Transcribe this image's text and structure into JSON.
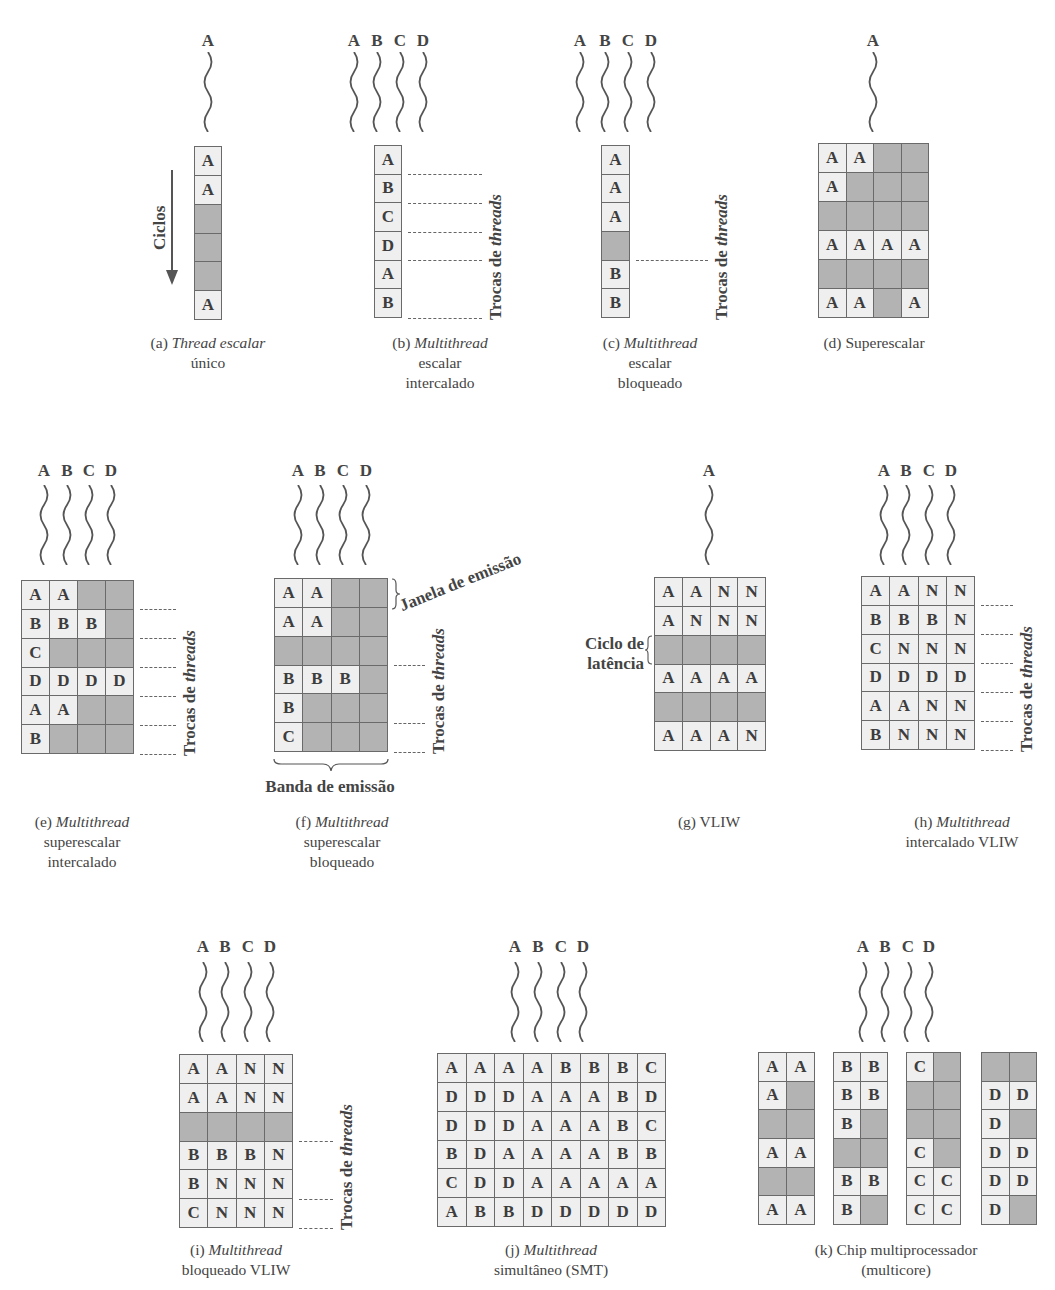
{
  "colors": {
    "filled_cell": "#efefef",
    "empty_cell": "#b3b3b3",
    "grid_line": "#6a6a6a",
    "text": "#3d3d3d"
  },
  "common": {
    "thread_switches_label_prefix": "Trocas de ",
    "thread_switches_label_italic": "threads",
    "cycles_label": "Ciclos",
    "issue_window_label": "Janela de emissão",
    "issue_slot_label": "Banda de emissão",
    "latency_cycle_label_line1": "Ciclo de",
    "latency_cycle_label_line2": "latência"
  },
  "panels": [
    {
      "id": "a",
      "threads": [
        "A"
      ],
      "caption": {
        "prefix": "(a) ",
        "italic": "Thread escalar",
        "rest_line1": "",
        "line2": "único",
        "line3": ""
      },
      "grid": [
        [
          "A"
        ],
        [
          "A"
        ],
        [
          ""
        ],
        [
          ""
        ],
        [
          ""
        ],
        [
          "A"
        ]
      ],
      "switch_rows": []
    },
    {
      "id": "b",
      "threads": [
        "A",
        "B",
        "C",
        "D"
      ],
      "caption": {
        "prefix": "(b) ",
        "italic": "Multithread",
        "rest_line1": "",
        "line2": "escalar",
        "line3": "intercalado"
      },
      "grid": [
        [
          "A"
        ],
        [
          "B"
        ],
        [
          "C"
        ],
        [
          "D"
        ],
        [
          "A"
        ],
        [
          "B"
        ]
      ],
      "switch_rows": [
        1,
        2,
        3,
        4,
        6
      ]
    },
    {
      "id": "c",
      "threads": [
        "A",
        "B",
        "C",
        "D"
      ],
      "caption": {
        "prefix": "(c) ",
        "italic": "Multithread",
        "rest_line1": "",
        "line2": "escalar",
        "line3": "bloqueado"
      },
      "grid": [
        [
          "A"
        ],
        [
          "A"
        ],
        [
          "A"
        ],
        [
          ""
        ],
        [
          "B"
        ],
        [
          "B"
        ]
      ],
      "switch_rows": [
        4
      ]
    },
    {
      "id": "d",
      "threads": [
        "A"
      ],
      "caption": {
        "prefix": "(d) ",
        "italic": "",
        "rest_line1": "Superescalar",
        "line2": "",
        "line3": ""
      },
      "grid": [
        [
          "A",
          "A",
          "",
          ""
        ],
        [
          "A",
          "",
          "",
          ""
        ],
        [
          "",
          "",
          "",
          ""
        ],
        [
          "A",
          "A",
          "A",
          "A"
        ],
        [
          "",
          "",
          "",
          ""
        ],
        [
          "A",
          "A",
          "",
          "A"
        ]
      ],
      "switch_rows": []
    },
    {
      "id": "e",
      "threads": [
        "A",
        "B",
        "C",
        "D"
      ],
      "caption": {
        "prefix": "(e) ",
        "italic": "Multithread",
        "rest_line1": "",
        "line2": "superescalar",
        "line3": "intercalado"
      },
      "grid": [
        [
          "A",
          "A",
          "",
          ""
        ],
        [
          "B",
          "B",
          "B",
          ""
        ],
        [
          "C",
          "",
          "",
          ""
        ],
        [
          "D",
          "D",
          "D",
          "D"
        ],
        [
          "A",
          "A",
          "",
          ""
        ],
        [
          "B",
          "",
          "",
          ""
        ]
      ],
      "switch_rows": [
        1,
        2,
        3,
        4,
        5,
        6
      ]
    },
    {
      "id": "f",
      "threads": [
        "A",
        "B",
        "C",
        "D"
      ],
      "caption": {
        "prefix": "(f) ",
        "italic": "Multithread",
        "rest_line1": "",
        "line2": "superescalar",
        "line3": "bloqueado"
      },
      "grid": [
        [
          "A",
          "A",
          "",
          ""
        ],
        [
          "A",
          "A",
          "",
          ""
        ],
        [
          "",
          "",
          "",
          ""
        ],
        [
          "B",
          "B",
          "B",
          ""
        ],
        [
          "B",
          "",
          "",
          ""
        ],
        [
          "C",
          "",
          "",
          ""
        ]
      ],
      "switch_rows": [
        3,
        5,
        6
      ]
    },
    {
      "id": "g",
      "threads": [
        "A"
      ],
      "caption": {
        "prefix": "(g) ",
        "italic": "",
        "rest_line1": "VLIW",
        "line2": "",
        "line3": ""
      },
      "grid": [
        [
          "A",
          "A",
          "N",
          "N"
        ],
        [
          "A",
          "N",
          "N",
          "N"
        ],
        [
          "",
          "",
          "",
          ""
        ],
        [
          "A",
          "A",
          "A",
          "A"
        ],
        [
          "",
          "",
          "",
          ""
        ],
        [
          "A",
          "A",
          "A",
          "N"
        ]
      ],
      "switch_rows": []
    },
    {
      "id": "h",
      "threads": [
        "A",
        "B",
        "C",
        "D"
      ],
      "caption": {
        "prefix": "(h) ",
        "italic": "Multithread",
        "rest_line1": "",
        "line2": "intercalado VLIW",
        "line3": ""
      },
      "grid": [
        [
          "A",
          "A",
          "N",
          "N"
        ],
        [
          "B",
          "B",
          "B",
          "N"
        ],
        [
          "C",
          "N",
          "N",
          "N"
        ],
        [
          "D",
          "D",
          "D",
          "D"
        ],
        [
          "A",
          "A",
          "N",
          "N"
        ],
        [
          "B",
          "N",
          "N",
          "N"
        ]
      ],
      "switch_rows": [
        1,
        2,
        3,
        4,
        5,
        6
      ]
    },
    {
      "id": "i",
      "threads": [
        "A",
        "B",
        "C",
        "D"
      ],
      "caption": {
        "prefix": "(i) ",
        "italic": "Multithread",
        "rest_line1": "",
        "line2": "bloqueado VLIW",
        "line3": ""
      },
      "grid": [
        [
          "A",
          "A",
          "N",
          "N"
        ],
        [
          "A",
          "A",
          "N",
          "N"
        ],
        [
          "",
          "",
          "",
          ""
        ],
        [
          "B",
          "B",
          "B",
          "N"
        ],
        [
          "B",
          "N",
          "N",
          "N"
        ],
        [
          "C",
          "N",
          "N",
          "N"
        ]
      ],
      "switch_rows": [
        3,
        5,
        6
      ]
    },
    {
      "id": "j",
      "threads": [
        "A",
        "B",
        "C",
        "D"
      ],
      "caption": {
        "prefix": "(j) ",
        "italic": "Multithread",
        "rest_line1": "",
        "line2": "simultâneo (SMT)",
        "line3": ""
      },
      "grid": [
        [
          "A",
          "A",
          "A",
          "A",
          "B",
          "B",
          "B",
          "C"
        ],
        [
          "D",
          "D",
          "D",
          "A",
          "A",
          "A",
          "B",
          "D"
        ],
        [
          "D",
          "D",
          "D",
          "A",
          "A",
          "A",
          "B",
          "C"
        ],
        [
          "B",
          "D",
          "A",
          "A",
          "A",
          "A",
          "B",
          "B"
        ],
        [
          "C",
          "D",
          "D",
          "A",
          "A",
          "A",
          "A",
          "A"
        ],
        [
          "A",
          "B",
          "B",
          "D",
          "D",
          "D",
          "D",
          "D"
        ]
      ],
      "switch_rows": []
    },
    {
      "id": "k",
      "threads": [
        "A",
        "B",
        "C",
        "D"
      ],
      "caption": {
        "prefix": "(k) ",
        "italic": "",
        "rest_line1": "Chip multiprocessador",
        "line2": "(multicore)",
        "line3": ""
      },
      "cores": [
        [
          [
            "A",
            "A"
          ],
          [
            "A",
            ""
          ],
          [
            "",
            ""
          ],
          [
            "A",
            "A"
          ],
          [
            "",
            ""
          ],
          [
            "A",
            "A"
          ]
        ],
        [
          [
            "B",
            "B"
          ],
          [
            "B",
            "B"
          ],
          [
            "B",
            ""
          ],
          [
            "",
            ""
          ],
          [
            "B",
            "B"
          ],
          [
            "B",
            ""
          ]
        ],
        [
          [
            "C",
            ""
          ],
          [
            "",
            ""
          ],
          [
            "",
            ""
          ],
          [
            "C",
            ""
          ],
          [
            "C",
            "C"
          ],
          [
            "C",
            "C"
          ]
        ],
        [
          [
            "",
            ""
          ],
          [
            "D",
            "D"
          ],
          [
            "D",
            ""
          ],
          [
            "D",
            "D"
          ],
          [
            "D",
            "D"
          ],
          [
            "D",
            ""
          ]
        ]
      ],
      "switch_rows": []
    }
  ]
}
